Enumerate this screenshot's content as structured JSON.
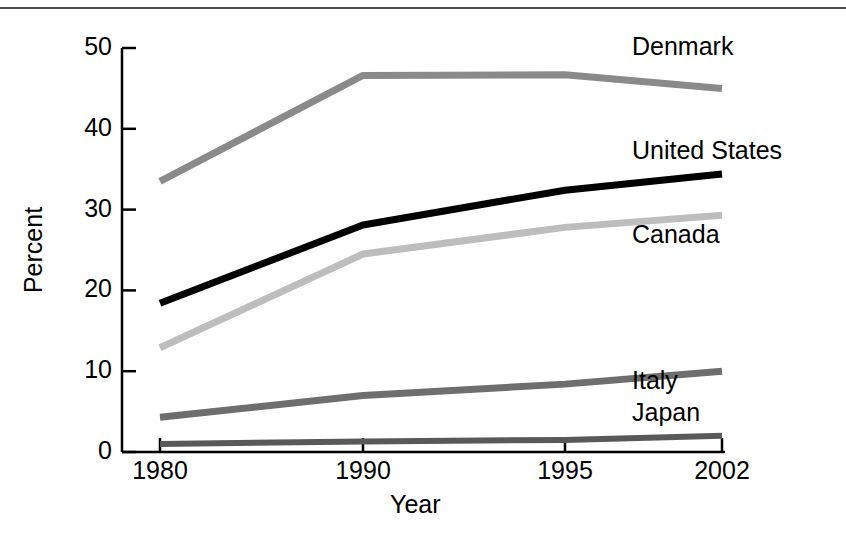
{
  "chart_data": {
    "type": "line",
    "title": "",
    "xlabel": "Year",
    "ylabel": "Percent",
    "categories": [
      "1980",
      "1990",
      "1995",
      "2002"
    ],
    "x_tick_labels": [
      "1980",
      "1990",
      "1995",
      "2002"
    ],
    "y_tick_labels": [
      "0",
      "10",
      "20",
      "30",
      "40",
      "50"
    ],
    "y_ticks": [
      0,
      10,
      20,
      30,
      40,
      50
    ],
    "ylim": [
      0,
      50
    ],
    "grid": false,
    "legend_position": "inline-right-of-lines",
    "series": [
      {
        "name": "Denmark",
        "color": "#8a8a8a",
        "line_width": 7,
        "values": [
          33.5,
          46.6,
          46.7,
          45.0
        ]
      },
      {
        "name": "United States",
        "color": "#000000",
        "line_width": 7,
        "values": [
          18.4,
          28.1,
          32.4,
          34.4
        ]
      },
      {
        "name": "Canada",
        "color": "#bdbdbd",
        "line_width": 7,
        "values": [
          12.9,
          24.5,
          27.8,
          29.3
        ]
      },
      {
        "name": "Italy",
        "color": "#6e6e6e",
        "line_width": 7,
        "values": [
          4.3,
          7.0,
          8.4,
          10.0
        ]
      },
      {
        "name": "Japan",
        "color": "#595959",
        "line_width": 6,
        "values": [
          1.0,
          1.3,
          1.5,
          2.0
        ]
      }
    ],
    "annotations": [
      {
        "text": "Denmark",
        "x": 632,
        "y": 34
      },
      {
        "text": "United States",
        "x": 632,
        "y": 138
      },
      {
        "text": "Canada",
        "x": 632,
        "y": 222
      },
      {
        "text": "Italy",
        "x": 632,
        "y": 368
      },
      {
        "text": "Japan",
        "x": 632,
        "y": 400
      }
    ]
  },
  "axes": {
    "y_axis_title": "Percent",
    "x_axis_title": "Year"
  }
}
